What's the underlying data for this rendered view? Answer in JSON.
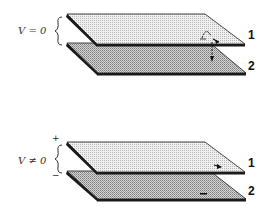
{
  "diagram": {
    "panels": [
      {
        "id": "uncharged",
        "voltage_label": "V = 0",
        "plate_labels": [
          "1",
          "2"
        ],
        "polarity": {
          "top": "",
          "bottom": ""
        },
        "annotation": "electron-tunneling arrows between plates"
      },
      {
        "id": "charged",
        "voltage_label": "V ≠ 0",
        "plate_labels": [
          "1",
          "2"
        ],
        "polarity": {
          "top": "+",
          "bottom": "−"
        },
        "annotation": "arrow on plate 1, minus sign on plate 2"
      }
    ],
    "colors": {
      "plate_top_fill": "#e6e6e6",
      "plate_bottom_fill": "#c8c8c8",
      "edge": "#1a1a1a",
      "text": "#222222"
    }
  }
}
